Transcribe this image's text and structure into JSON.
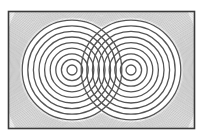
{
  "diagram": {
    "type": "two-source wave interference",
    "frame": {
      "x": 8.5,
      "y": 11.5,
      "width": 186,
      "height": 117,
      "stroke": "#3a3a3a",
      "stroke_width": 1.6,
      "fill": "#ffffff"
    },
    "sources": [
      {
        "name": "left-source",
        "cx": 72,
        "cy": 70
      },
      {
        "name": "right-source",
        "cx": 131,
        "cy": 70
      }
    ],
    "main_rings": {
      "count": 9,
      "start_radius": 5,
      "spacing": 5.6,
      "stroke": "#555555",
      "stroke_width": 1.3
    },
    "background_rings": {
      "start_radius": 53,
      "end_radius": 130,
      "spacing": 1.15,
      "stroke": "#9a9a9a",
      "stroke_width": 0.35
    },
    "colors": {
      "ring": "#555555",
      "hairline": "#9a9a9a",
      "frame": "#3a3a3a",
      "background": "#ffffff"
    }
  }
}
